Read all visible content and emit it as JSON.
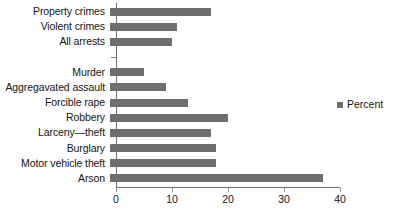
{
  "chart_data": {
    "type": "bar",
    "orientation": "horizontal",
    "title": "",
    "xlabel": "",
    "ylabel": "",
    "xlim": [
      0,
      40
    ],
    "xticks": [
      0,
      10,
      20,
      30,
      40
    ],
    "xtick_labels": [
      "0",
      "10",
      "20",
      "30",
      "40"
    ],
    "grid": false,
    "legend_position": "right",
    "series": [
      {
        "name": "Percent",
        "color": "#6e6e6e",
        "values": [
          18,
          12,
          11,
          null,
          6,
          10,
          14,
          21,
          18,
          19,
          19,
          38
        ]
      }
    ],
    "categories": [
      "Property crimes",
      "Violent crimes",
      "All arrests",
      "",
      "Murder",
      "Aggregavated assault",
      "Forcible rape",
      "Robbery",
      "Larceny—theft",
      "Burglary",
      "Motor vehicle theft",
      "Arson"
    ]
  },
  "legend": {
    "entries": [
      {
        "label": "Percent",
        "swatch_name": "legend-swatch-percent"
      }
    ]
  }
}
